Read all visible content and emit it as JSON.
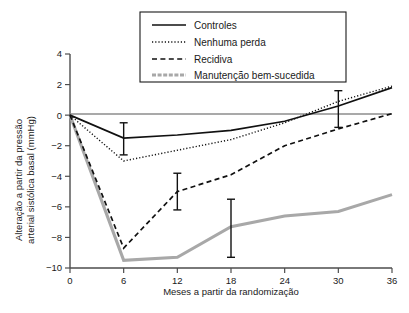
{
  "chart_data": {
    "type": "line",
    "title": "",
    "xlabel": "Meses a partir da randomização",
    "ylabel": "Alteração a partir da pressão arterial sistólica basal (mmHg)",
    "x": [
      0,
      6,
      12,
      18,
      24,
      30,
      36
    ],
    "xlim": [
      0,
      36
    ],
    "ylim": [
      -10,
      4
    ],
    "xticks": [
      0,
      6,
      12,
      18,
      24,
      30,
      36
    ],
    "xticklabels": [
      "0",
      "6",
      "12",
      "18",
      "24",
      "30",
      "36"
    ],
    "yticks": [
      -10,
      -8,
      -6,
      -4,
      -2,
      0,
      2,
      4
    ],
    "yticklabels": [
      "−10",
      "−8",
      "−6",
      "−4",
      "−2",
      "0",
      "2",
      "4"
    ],
    "grid": false,
    "legend_position": "top-center",
    "series": [
      {
        "name": "Controles",
        "style": "solid",
        "color": "#111111",
        "values": [
          0,
          -1.5,
          -1.3,
          -1.0,
          -0.4,
          0.6,
          1.8
        ],
        "error_bars": [
          {
            "x": 6,
            "low": -2.6,
            "high": -0.5
          },
          {
            "x": 30,
            "low": -0.8,
            "high": 1.6
          }
        ]
      },
      {
        "name": "Nenhuma perda",
        "style": "dotted",
        "color": "#111111",
        "values": [
          0,
          -3.0,
          -2.3,
          -1.6,
          -0.5,
          0.9,
          1.9
        ]
      },
      {
        "name": "Recidiva",
        "style": "dashed",
        "color": "#111111",
        "values": [
          0,
          -8.7,
          -5.0,
          -3.9,
          -2.0,
          -0.9,
          0.1
        ],
        "error_bars": [
          {
            "x": 12,
            "low": -6.2,
            "high": -3.8
          }
        ]
      },
      {
        "name": "Manutenção bem-sucedida",
        "style": "thick-solid",
        "color": "#a8a8a8",
        "values": [
          0,
          -9.5,
          -9.3,
          -7.3,
          -6.6,
          -6.3,
          -5.2
        ],
        "error_bars": [
          {
            "x": 18,
            "low": -9.3,
            "high": -5.5
          }
        ]
      }
    ]
  },
  "legend": {
    "items": [
      {
        "label": "Controles",
        "style": "solid"
      },
      {
        "label": "Nenhuma perda",
        "style": "dotted"
      },
      {
        "label": "Recidiva",
        "style": "dashed"
      },
      {
        "label": "Manutenção bem-sucedida",
        "style": "thick-solid"
      }
    ]
  }
}
